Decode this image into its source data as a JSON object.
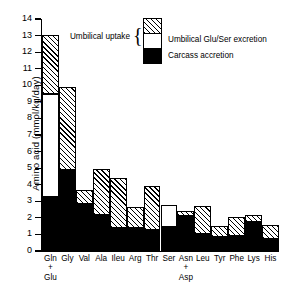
{
  "chart_data": {
    "type": "bar",
    "subtype": "stacked-bar",
    "title": "",
    "xlabel": "",
    "ylabel": "Amino acid (mmol/kg/day)",
    "ylim": [
      0,
      14
    ],
    "ytick_values": [
      0,
      1,
      2,
      3,
      4,
      5,
      6,
      7,
      8,
      9,
      10,
      11,
      12,
      13,
      14
    ],
    "ytick_labels": [
      "0",
      "1",
      "2",
      "3",
      "4",
      "5",
      "6",
      "7",
      "8",
      "9",
      "10",
      "11",
      "12",
      "13",
      "14"
    ],
    "grid": false,
    "legend_position": "top-center",
    "categories": [
      "Gln + Glu",
      "Gly",
      "Val",
      "Ala",
      "Ileu",
      "Arg",
      "Thr",
      "Ser",
      "Asn + Asp",
      "Leu",
      "Tyr",
      "Phe",
      "Lys",
      "His"
    ],
    "category_lines": [
      [
        "Gln",
        "+",
        "Glu"
      ],
      [
        "Gly"
      ],
      [
        "Val"
      ],
      [
        "Ala"
      ],
      [
        "Ileu"
      ],
      [
        "Arg"
      ],
      [
        "Thr"
      ],
      [
        "Ser"
      ],
      [
        "Asn",
        "+",
        "Asp"
      ],
      [
        "Leu"
      ],
      [
        "Tyr"
      ],
      [
        "Phe"
      ],
      [
        "Lys"
      ],
      [
        "His"
      ]
    ],
    "series": [
      {
        "name": "Carcass accretion",
        "style": "solid-black",
        "color": "#000000",
        "values": [
          3.25,
          4.9,
          2.85,
          2.15,
          1.4,
          1.4,
          1.25,
          1.45,
          2.1,
          1.0,
          0.85,
          0.9,
          1.75,
          0.7
        ]
      },
      {
        "name": "Umbilical Glu/Ser excretion",
        "style": "white",
        "color": "#ffffff",
        "values": [
          6.25,
          0.0,
          0.0,
          0.0,
          0.0,
          0.0,
          0.0,
          1.3,
          0.0,
          0.0,
          0.0,
          0.0,
          0.0,
          0.0
        ]
      },
      {
        "name": "Umbilical uptake (hatched)",
        "style": "hatched",
        "color": "#ffffff",
        "values": [
          3.55,
          5.0,
          0.82,
          2.8,
          3.0,
          1.25,
          2.65,
          0.0,
          0.3,
          1.7,
          0.65,
          1.15,
          0.45,
          0.85
        ]
      }
    ],
    "totals": [
      13.05,
      9.9,
      3.67,
      4.95,
      4.4,
      2.65,
      3.9,
      2.75,
      2.4,
      2.7,
      1.5,
      2.05,
      2.2,
      1.55
    ]
  },
  "legend": {
    "bracket_label": "Umbilical uptake",
    "brace_glyph": "{",
    "entries": [
      {
        "key": "hatched",
        "label": ""
      },
      {
        "key": "white",
        "label": "Umbilical Glu/Ser excretion"
      },
      {
        "key": "black",
        "label": "Carcass accretion"
      }
    ],
    "label_excretion": "Umbilical Glu/Ser excretion",
    "label_accretion": "Carcass accretion"
  }
}
